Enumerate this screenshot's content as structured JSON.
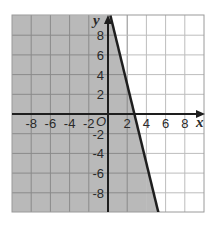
{
  "chart_data": {
    "type": "line",
    "title": "",
    "xlabel": "x",
    "ylabel": "y",
    "origin_label": "O",
    "xlim": [
      -10,
      10
    ],
    "ylim": [
      -10,
      10
    ],
    "grid": true,
    "grid_step": 2,
    "x_ticks": [
      "-8",
      "-6",
      "-4",
      "-2",
      "2",
      "4",
      "6",
      "8"
    ],
    "y_ticks": [
      "8",
      "6",
      "4",
      "2",
      "-2",
      "-4",
      "-6",
      "-8"
    ],
    "boundary_line": {
      "style": "solid",
      "points": [
        [
          0.25,
          10
        ],
        [
          5.25,
          -10
        ]
      ],
      "x_intercept": 2.75,
      "approx_equation": "y = -4x + 11"
    },
    "shaded_region": "left of boundary line (4x + y <= 11)",
    "colors": {
      "shade": "#b9b9b9",
      "grid_line_shaded": "#8a8a8a",
      "grid_line_unshaded": "#bdbdbd",
      "axis": "#1e1e1e",
      "boundary": "#1e1e1e"
    }
  }
}
